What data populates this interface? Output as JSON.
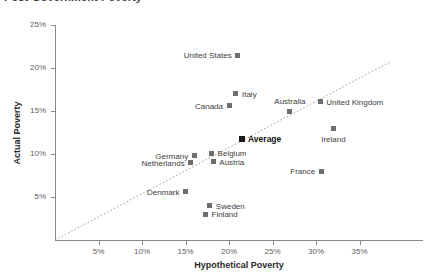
{
  "chart_data": {
    "type": "scatter",
    "title": "Post-Government Poverty",
    "xlabel": "Hypothetical Poverty",
    "ylabel": "Actual Poverty",
    "xlim": [
      0,
      40
    ],
    "ylim": [
      0,
      25
    ],
    "xticks": [
      "5%",
      "10%",
      "15%",
      "20%",
      "25%",
      "30%",
      "35%"
    ],
    "xtick_values": [
      5,
      10,
      15,
      20,
      25,
      30,
      35
    ],
    "yticks": [
      "5%",
      "10%",
      "15%",
      "20%",
      "25%"
    ],
    "ytick_values": [
      5,
      10,
      15,
      20,
      25
    ],
    "grid": false,
    "legend": "none",
    "annotations": [
      {
        "name": "identity-reference-line",
        "type": "dotted-diagonal",
        "description": "y = x reference line",
        "from": [
          0,
          0
        ],
        "to": [
          38.5,
          20.7
        ]
      }
    ],
    "points": [
      {
        "label": "United States",
        "x": 21.0,
        "y": 21.5,
        "label_pos": "left"
      },
      {
        "label": "Italy",
        "x": 20.8,
        "y": 17.0,
        "label_pos": "right"
      },
      {
        "label": "Australia",
        "x": 27.0,
        "y": 15.0,
        "label_pos": "above"
      },
      {
        "label": "United Kingdom",
        "x": 30.5,
        "y": 16.1,
        "label_pos": "right"
      },
      {
        "label": "Canada",
        "x": 20.0,
        "y": 15.6,
        "label_pos": "left"
      },
      {
        "label": "Ireland",
        "x": 32.0,
        "y": 13.0,
        "label_pos": "below"
      },
      {
        "label": "Average",
        "x": 21.5,
        "y": 11.8,
        "label_pos": "right"
      },
      {
        "label": "Belgium",
        "x": 18.0,
        "y": 10.1,
        "label_pos": "right"
      },
      {
        "label": "Germany",
        "x": 16.0,
        "y": 9.8,
        "label_pos": "left"
      },
      {
        "label": "Austria",
        "x": 18.2,
        "y": 9.1,
        "label_pos": "right"
      },
      {
        "label": "Netherlands",
        "x": 15.6,
        "y": 9.0,
        "label_pos": "left"
      },
      {
        "label": "France",
        "x": 30.6,
        "y": 8.0,
        "label_pos": "left"
      },
      {
        "label": "Denmark",
        "x": 15.0,
        "y": 5.6,
        "label_pos": "left"
      },
      {
        "label": "Sweden",
        "x": 17.8,
        "y": 4.0,
        "label_pos": "right"
      },
      {
        "label": "Finland",
        "x": 17.3,
        "y": 3.0,
        "label_pos": "right"
      }
    ]
  },
  "colors": {
    "marker": "#6e6e6e",
    "marker_highlight": "#1c1c1c",
    "axis": "#8a8a8a",
    "text": "#3d3d3d",
    "background": "#ffffff"
  }
}
